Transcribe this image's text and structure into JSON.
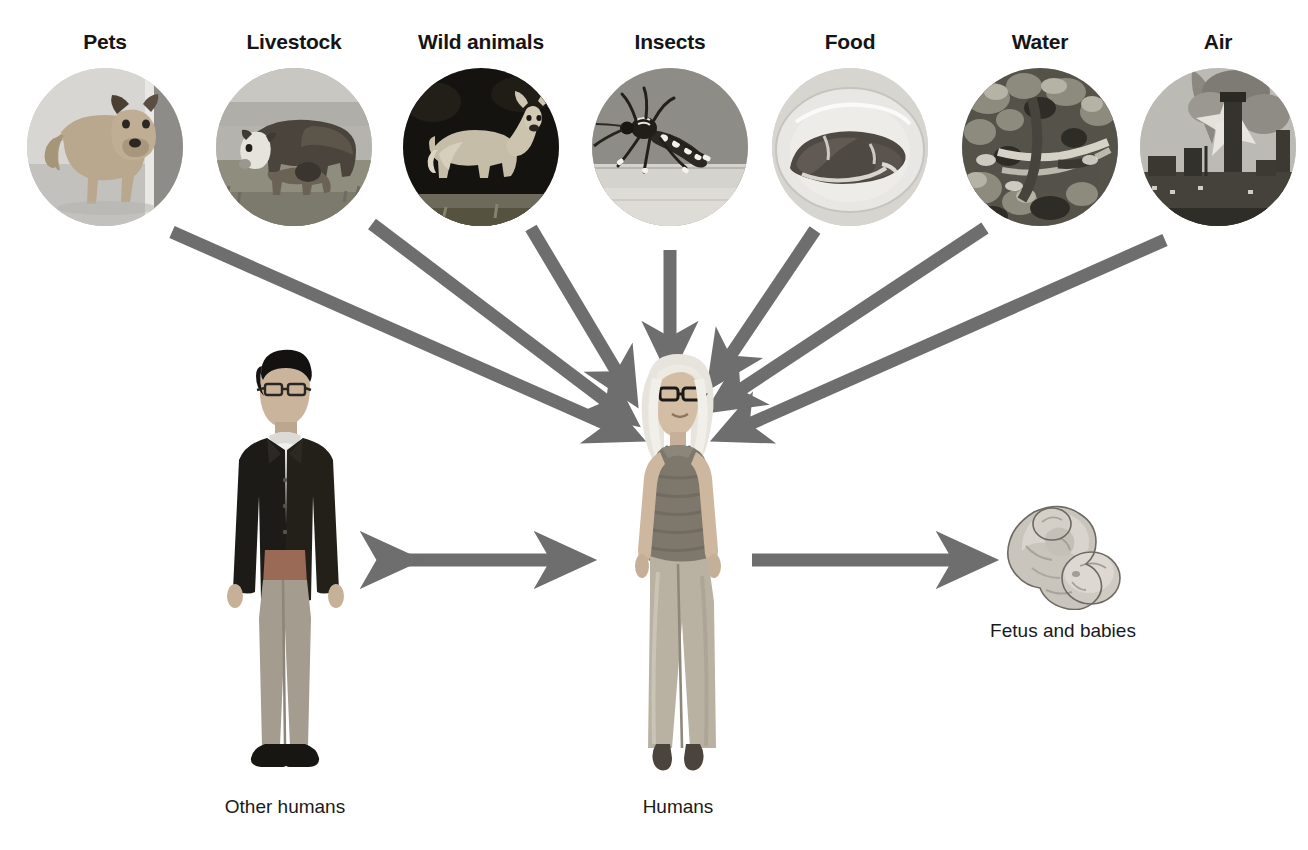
{
  "diagram": {
    "arrow_color": "#6e6e6e",
    "label_color": "#151515",
    "caption_color": "#1a1a1a",
    "background": "#ffffff"
  },
  "sources": [
    {
      "id": "pets",
      "label": "Pets",
      "icon": "dog-photo-circle",
      "cx": 105,
      "cy": 155
    },
    {
      "id": "livestock",
      "label": "Livestock",
      "icon": "cow-photo-circle",
      "cx": 294,
      "cy": 155
    },
    {
      "id": "wild",
      "label": "Wild animals",
      "icon": "deer-photo-circle",
      "cx": 481,
      "cy": 155
    },
    {
      "id": "insects",
      "label": "Insects",
      "icon": "mosquito-photo-circle",
      "cx": 670,
      "cy": 155
    },
    {
      "id": "food",
      "label": "Food",
      "icon": "meat-photo-circle",
      "cx": 850,
      "cy": 155
    },
    {
      "id": "water",
      "label": "Water",
      "icon": "water-photo-circle",
      "cx": 1040,
      "cy": 155
    },
    {
      "id": "air",
      "label": "Air",
      "icon": "smokestack-photo-circle",
      "cx": 1218,
      "cy": 155
    }
  ],
  "figures": [
    {
      "id": "other-humans",
      "caption": "Other humans",
      "icon": "man-standing-photo",
      "cx": 285,
      "caption_y": 808
    },
    {
      "id": "humans",
      "caption": "Humans",
      "icon": "woman-standing-photo",
      "cx": 678,
      "caption_y": 808
    },
    {
      "id": "fetus",
      "caption": "Fetus and babies",
      "icon": "fetus-illustration",
      "cx": 1063,
      "caption_y": 638
    }
  ],
  "arrows": [
    {
      "id": "pets-to-humans",
      "from": "pets",
      "to": "humans",
      "style": "single"
    },
    {
      "id": "livestock-to-humans",
      "from": "livestock",
      "to": "humans",
      "style": "single"
    },
    {
      "id": "wild-to-humans",
      "from": "wild",
      "to": "humans",
      "style": "single"
    },
    {
      "id": "insects-to-humans",
      "from": "insects",
      "to": "humans",
      "style": "single"
    },
    {
      "id": "food-to-humans",
      "from": "food",
      "to": "humans",
      "style": "single"
    },
    {
      "id": "water-to-humans",
      "from": "water",
      "to": "humans",
      "style": "single"
    },
    {
      "id": "air-to-humans",
      "from": "air",
      "to": "humans",
      "style": "single"
    },
    {
      "id": "humans-other-humans",
      "from": "humans",
      "to": "other-humans",
      "style": "double"
    },
    {
      "id": "humans-to-fetus",
      "from": "humans",
      "to": "fetus",
      "style": "single"
    }
  ]
}
